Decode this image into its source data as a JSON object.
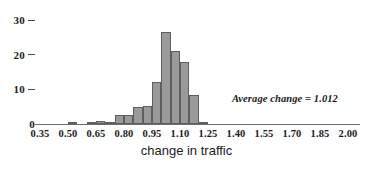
{
  "chart_data": {
    "type": "bar",
    "title": "",
    "subtitle": "",
    "xlabel": "change in traffic",
    "ylabel": "",
    "xlim": [
      0.3,
      2.05
    ],
    "ylim": [
      0,
      31
    ],
    "grid": false,
    "legend": null,
    "bin_width": 0.05,
    "xticks": [
      "0.35",
      "0.50",
      "0.65",
      "0.80",
      "0.95",
      "1.10",
      "1.25",
      "1.40",
      "1.55",
      "1.70",
      "1.85",
      "2.00"
    ],
    "xtick_values": [
      0.35,
      0.5,
      0.65,
      0.8,
      0.95,
      1.1,
      1.25,
      1.4,
      1.55,
      1.7,
      1.85,
      2.0
    ],
    "yticks": [
      "0",
      "10",
      "20",
      "30"
    ],
    "ytick_values": [
      0,
      10,
      20,
      30
    ],
    "bin_starts": [
      0.5,
      0.6,
      0.65,
      0.7,
      0.75,
      0.8,
      0.85,
      0.9,
      0.95,
      1.0,
      1.05,
      1.1,
      1.15
    ],
    "values": [
      0.3,
      0.3,
      0.8,
      0.3,
      2.5,
      2.5,
      5.0,
      5.2,
      12.0,
      26.5,
      21.0,
      18.0,
      8.5
    ],
    "trailing_bin_start": 1.2,
    "trailing_value": 0.4,
    "annotations": [
      {
        "text": "Average change = 1.012",
        "value": 1.012
      }
    ],
    "bar_fill": "#9a9a9a",
    "bar_stroke": "#5e5e5e",
    "axis_color": "#6b6b6b",
    "text_color": "#1a1a1a",
    "background": "#ffffff"
  },
  "axis": {
    "x_title": "change in traffic"
  },
  "note": {
    "average_label": "Average change = 1.012"
  }
}
